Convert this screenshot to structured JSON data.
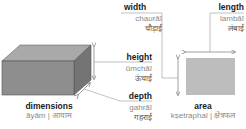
{
  "terms": {
    "dimensions": {
      "english": "dimensions",
      "transliteration_hindi": "āyām | आयाम"
    },
    "height": {
      "english": "height",
      "transliteration": "ūmchāī",
      "hindi": "ऊंचाई"
    },
    "depth": {
      "english": "depth",
      "transliteration": "gahrāī",
      "hindi": "गहराई"
    },
    "width": {
      "english": "width",
      "transliteration": "chaurāī",
      "hindi": "चौड़ाई"
    },
    "length": {
      "english": "length",
      "transliteration": "lambāī",
      "hindi": "लंबाई"
    },
    "area": {
      "english": "area",
      "transliteration_hindi": "kṣetraphal | क्षेत्रफल"
    }
  },
  "colors": {
    "box_front": "#8c8c8c",
    "box_top": "#a9a9a9",
    "box_side": "#7a7a7a",
    "area_fill": "#bdbdbd",
    "line": "#888888"
  }
}
